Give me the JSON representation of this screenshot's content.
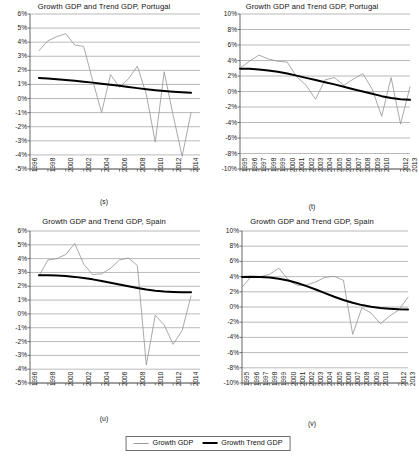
{
  "figure": {
    "legend": {
      "series_growth_label": "Growth GDP",
      "series_trend_label": "Growth Trend GDP",
      "growth_color": "#9a9a9a",
      "trend_color": "#000000"
    }
  },
  "panels": [
    {
      "key": "s",
      "caption": "(s)",
      "title": "Growth GDP and Trend GDP, Portugal",
      "chart_data": {
        "type": "line",
        "title": "Growth GDP and Trend GDP, Portugal",
        "xlabel": "",
        "ylabel": "",
        "ylim": [
          -5,
          6
        ],
        "yticks": [
          6,
          5,
          4,
          3,
          2,
          1,
          0,
          -1,
          -2,
          -3,
          -4,
          -5
        ],
        "ytick_labels": [
          "6%",
          "5%",
          "4%",
          "3%",
          "2%",
          "1%",
          "0%",
          "-1%",
          "-2%",
          "-3%",
          "-4%",
          "-5%"
        ],
        "xlim": [
          1996,
          2015
        ],
        "xticks": [
          1996,
          1998,
          2000,
          2002,
          2004,
          2006,
          2008,
          2010,
          2012,
          2014
        ],
        "xtick_labels": [
          "1996",
          "1998",
          "2000",
          "2002",
          "2004",
          "2006",
          "2008",
          "2010",
          "2012",
          "2014"
        ],
        "grid": "horizontal",
        "legend_position": "figure-bottom",
        "x": [
          1997,
          1998,
          1999,
          2000,
          2001,
          2002,
          2003,
          2004,
          2005,
          2006,
          2007,
          2008,
          2009,
          2010,
          2011,
          2012,
          2013,
          2014
        ],
        "series": [
          {
            "name": "Growth GDP",
            "color": "#9a9a9a",
            "values": [
              3.4,
              4.1,
              4.4,
              4.6,
              3.8,
              3.7,
              1.3,
              -1.0,
              1.7,
              0.8,
              1.4,
              2.3,
              0.3,
              -3.1,
              1.9,
              -1.2,
              -4.1,
              -1.0
            ]
          },
          {
            "name": "Growth Trend GDP",
            "color": "#000000",
            "values": [
              1.45,
              1.42,
              1.37,
              1.32,
              1.26,
              1.2,
              1.13,
              1.05,
              0.98,
              0.9,
              0.82,
              0.74,
              0.66,
              0.59,
              0.53,
              0.48,
              0.44,
              0.41
            ]
          }
        ]
      }
    },
    {
      "key": "t",
      "caption": "(t)",
      "title": "Growth GDP and Trend GDP, Portugal",
      "chart_data": {
        "type": "line",
        "title": "Growth GDP and Trend GDP, Portugal",
        "xlabel": "",
        "ylabel": "",
        "ylim": [
          -10,
          10
        ],
        "yticks": [
          10,
          8,
          6,
          4,
          2,
          0,
          -2,
          -4,
          -6,
          -8,
          -10
        ],
        "ytick_labels": [
          "10%",
          "8%",
          "6%",
          "4%",
          "2%",
          "0%",
          "-2%",
          "-4%",
          "-6%",
          "-8%",
          "-10%"
        ],
        "xlim": [
          1995,
          2013
        ],
        "xticks": [
          1995,
          1996,
          1997,
          1998,
          1999,
          2000,
          2001,
          2002,
          2003,
          2004,
          2005,
          2006,
          2007,
          2008,
          2009,
          2010,
          2012,
          2013
        ],
        "xtick_labels": [
          "1995",
          "1996",
          "1997",
          "1998",
          "1999",
          "2000",
          "2001",
          "2002",
          "2003",
          "2004",
          "2005",
          "2006",
          "2007",
          "2008",
          "2009",
          "2010",
          "2012",
          "2013"
        ],
        "grid": "horizontal",
        "legend_position": "figure-bottom",
        "x": [
          1995,
          1996,
          1997,
          1998,
          1999,
          2000,
          2001,
          2002,
          2003,
          2004,
          2005,
          2006,
          2007,
          2008,
          2009,
          2010,
          2011,
          2012,
          2013
        ],
        "series": [
          {
            "name": "Growth GDP",
            "color": "#9a9a9a",
            "values": [
              3.0,
              3.9,
              4.7,
              4.2,
              3.9,
              3.8,
              1.9,
              0.8,
              -1.0,
              1.5,
              1.8,
              0.8,
              1.6,
              2.3,
              0.3,
              -3.2,
              1.8,
              -4.2,
              0.6
            ]
          },
          {
            "name": "Growth Trend GDP",
            "color": "#000000",
            "values": [
              2.95,
              2.92,
              2.85,
              2.72,
              2.55,
              2.32,
              2.05,
              1.76,
              1.48,
              1.2,
              0.92,
              0.62,
              0.3,
              0.0,
              -0.3,
              -0.6,
              -0.84,
              -1.0,
              -1.08
            ]
          }
        ]
      }
    },
    {
      "key": "u",
      "caption": "(u)",
      "title": "Growth GDP and Trend GDP, Spain",
      "chart_data": {
        "type": "line",
        "title": "Growth GDP and Trend GDP, Spain",
        "xlabel": "",
        "ylabel": "",
        "ylim": [
          -5,
          6
        ],
        "yticks": [
          6,
          5,
          4,
          3,
          2,
          1,
          0,
          -1,
          -2,
          -3,
          -4,
          -5
        ],
        "ytick_labels": [
          "6%",
          "5%",
          "4%",
          "3%",
          "2%",
          "1%",
          "0%",
          "-1%",
          "-2%",
          "-3%",
          "-4%",
          "-5%"
        ],
        "xlim": [
          1996,
          2015
        ],
        "xticks": [
          1996,
          1998,
          2000,
          2002,
          2004,
          2006,
          2008,
          2010,
          2012,
          2014
        ],
        "xtick_labels": [
          "1996",
          "1998",
          "2000",
          "2002",
          "2004",
          "2006",
          "2008",
          "2010",
          "2012",
          "2014"
        ],
        "grid": "horizontal",
        "legend_position": "figure-bottom",
        "x": [
          1997,
          1998,
          1999,
          2000,
          2001,
          2002,
          2003,
          2004,
          2005,
          2006,
          2007,
          2008,
          2009,
          2010,
          2011,
          2012,
          2013,
          2014
        ],
        "series": [
          {
            "name": "Growth GDP",
            "color": "#9a9a9a",
            "values": [
              2.75,
              3.9,
              4.0,
              4.3,
              5.1,
              3.6,
              2.85,
              2.9,
              3.3,
              3.9,
              4.05,
              3.5,
              -3.7,
              -0.1,
              -0.8,
              -2.2,
              -1.2,
              1.3
            ]
          },
          {
            "name": "Growth Trend GDP",
            "color": "#000000",
            "values": [
              2.8,
              2.8,
              2.78,
              2.74,
              2.68,
              2.6,
              2.5,
              2.38,
              2.26,
              2.13,
              2.0,
              1.88,
              1.76,
              1.68,
              1.62,
              1.59,
              1.57,
              1.56
            ]
          }
        ]
      }
    },
    {
      "key": "v",
      "caption": "(v)",
      "title": "Growth GDP and Trend GDP, Spain",
      "chart_data": {
        "type": "line",
        "title": "Growth GDP and Trend GDP, Spain",
        "xlabel": "",
        "ylabel": "",
        "ylim": [
          -10,
          10
        ],
        "yticks": [
          10,
          8,
          6,
          4,
          2,
          0,
          -2,
          -4,
          -6,
          -8,
          -10
        ],
        "ytick_labels": [
          "10%",
          "8%",
          "6%",
          "4%",
          "2%",
          "0%",
          "-2%",
          "-4%",
          "-6%",
          "-8%",
          "-10%"
        ],
        "xlim": [
          1995,
          2013
        ],
        "xticks": [
          1995,
          1996,
          1997,
          1998,
          1999,
          2000,
          2001,
          2002,
          2003,
          2004,
          2005,
          2006,
          2007,
          2008,
          2009,
          2010,
          2012,
          2013
        ],
        "xtick_labels": [
          "1995",
          "1996",
          "1997",
          "1998",
          "1999",
          "2000",
          "2001",
          "2002",
          "2003",
          "2004",
          "2005",
          "2006",
          "2007",
          "2008",
          "2009",
          "2010",
          "2012",
          "2013"
        ],
        "grid": "horizontal",
        "legend_position": "figure-bottom",
        "x": [
          1995,
          1996,
          1997,
          1998,
          1999,
          2000,
          2001,
          2002,
          2003,
          2004,
          2005,
          2006,
          2007,
          2008,
          2009,
          2010,
          2011,
          2012,
          2013
        ],
        "series": [
          {
            "name": "Growth GDP",
            "color": "#9a9a9a",
            "values": [
              2.6,
              4.0,
              4.0,
              4.3,
              5.1,
              3.6,
              2.85,
              2.9,
              3.3,
              3.9,
              4.05,
              3.5,
              -3.6,
              -0.1,
              -0.8,
              -2.2,
              -1.2,
              -0.4,
              1.3
            ]
          },
          {
            "name": "Growth Trend GDP",
            "color": "#000000",
            "values": [
              3.95,
              3.97,
              3.95,
              3.88,
              3.72,
              3.48,
              3.15,
              2.75,
              2.3,
              1.82,
              1.35,
              0.92,
              0.55,
              0.25,
              0.02,
              -0.12,
              -0.22,
              -0.3,
              -0.32
            ]
          }
        ]
      }
    }
  ]
}
